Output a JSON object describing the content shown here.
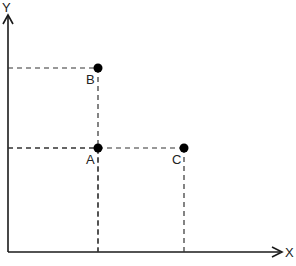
{
  "diagram": {
    "axes": {
      "x_label": "X",
      "y_label": "Y"
    },
    "points": [
      {
        "id": "B",
        "label": "B",
        "x": 1,
        "y": 2
      },
      {
        "id": "A",
        "label": "A",
        "x": 1,
        "y": 1
      },
      {
        "id": "C",
        "label": "C",
        "x": 2,
        "y": 1
      }
    ],
    "colors": {
      "axis": "#1a1a1a",
      "point": "#000000",
      "guide": "#333333"
    }
  }
}
